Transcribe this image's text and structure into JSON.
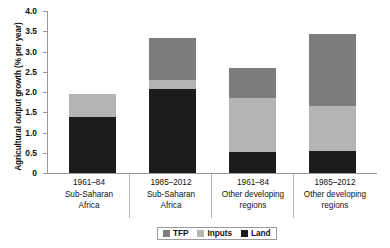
{
  "chart_data": {
    "type": "bar",
    "subtype": "stacked",
    "title": "",
    "xlabel": "",
    "ylabel": "Agricultural output growth (% per year)",
    "ylim": [
      0,
      4.0
    ],
    "ytick_labels": [
      "0",
      "0.5",
      "1.0",
      "1.5",
      "2.0",
      "2.5",
      "3.0",
      "3.5",
      "4.0"
    ],
    "ytick_values": [
      0,
      0.5,
      1.0,
      1.5,
      2.0,
      2.5,
      3.0,
      3.5,
      4.0
    ],
    "grid": false,
    "legend_position": "bottom-center",
    "categories": [
      {
        "period": "1961–84",
        "region_line1": "Sub-Saharan",
        "region_line2": "Africa"
      },
      {
        "period": "1985–2012",
        "region_line1": "Sub-Saharan",
        "region_line2": "Africa"
      },
      {
        "period": "1961–84",
        "region_line1": "Other developing",
        "region_line2": "regions"
      },
      {
        "period": "1985–2012",
        "region_line1": "Other developing",
        "region_line2": "regions"
      }
    ],
    "series": [
      {
        "name": "Land",
        "color": "#1c1c1c",
        "values": [
          1.38,
          2.08,
          0.52,
          0.54
        ]
      },
      {
        "name": "Inputs",
        "color": "#b4b4b4",
        "values": [
          0.57,
          0.22,
          1.33,
          1.12
        ]
      },
      {
        "name": "TFP",
        "color": "#7d7d7d",
        "values": [
          0.0,
          1.03,
          0.75,
          1.77
        ]
      }
    ],
    "totals": [
      1.95,
      3.33,
      2.6,
      3.43
    ],
    "legend": [
      {
        "label": "TFP",
        "color": "#7d7d7d"
      },
      {
        "label": "Inputs",
        "color": "#b4b4b4"
      },
      {
        "label": "Land",
        "color": "#1c1c1c"
      }
    ]
  }
}
